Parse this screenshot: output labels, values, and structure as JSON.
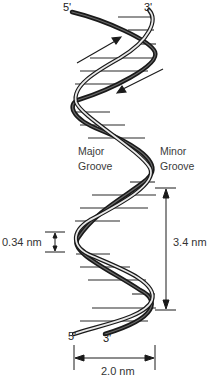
{
  "diagram": {
    "strand_ends": {
      "top_left": "5'",
      "top_right": "3'",
      "bottom_left": "5'",
      "bottom_right": "3'"
    },
    "grooves": {
      "major_line1": "Major",
      "major_line2": "Groove",
      "minor_line1": "Minor",
      "minor_line2": "Groove"
    },
    "measurements": {
      "base_pair_spacing": "0.34 nm",
      "helical_turn": "3.4 nm",
      "diameter": "2.0 nm"
    },
    "strand_direction_arrows": [
      "up-right",
      "down-left"
    ],
    "colors": {
      "strand_dark": "#1a1a1a",
      "strand_light": "#e8e8e8",
      "rungs": "#2a2a2a",
      "text": "#333333",
      "background": "#ffffff"
    }
  }
}
